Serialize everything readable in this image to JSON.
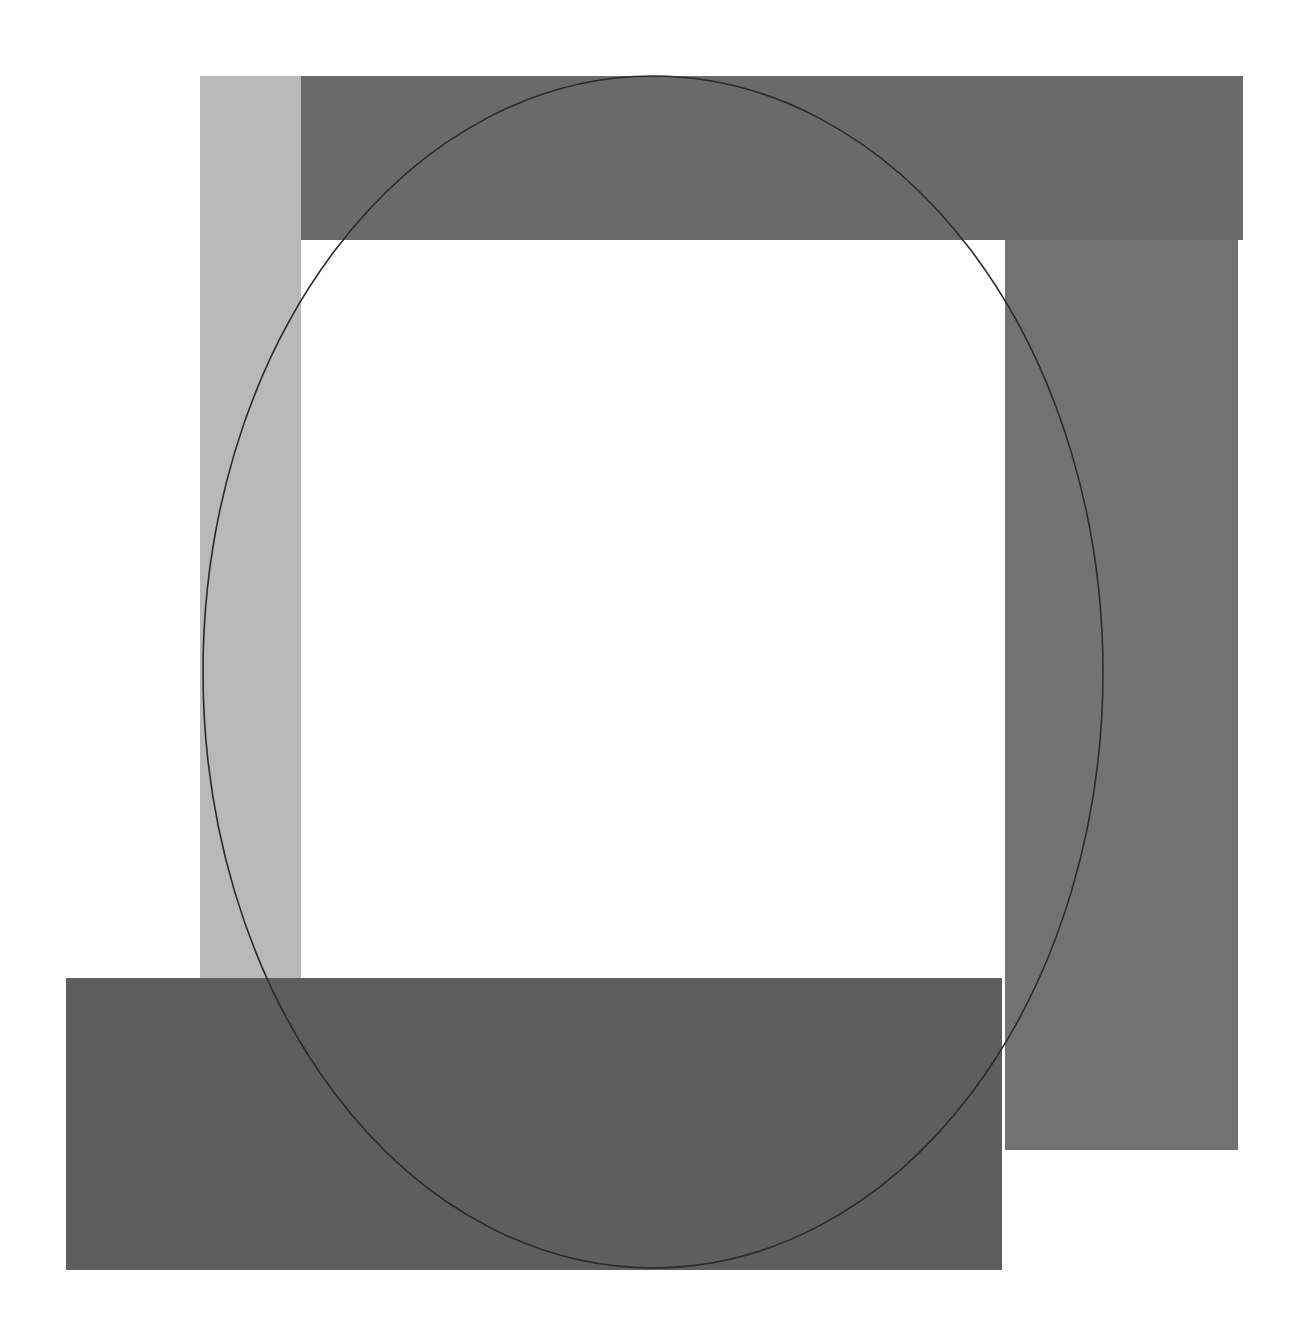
{
  "artwork": {
    "background": "#ffffff",
    "shapes": [
      {
        "name": "left-light-bar",
        "x": 200,
        "y": 76,
        "w": 101,
        "h": 904,
        "color": "#b9b9b9"
      },
      {
        "name": "top-dark-bar",
        "x": 301,
        "y": 76,
        "w": 942,
        "h": 164,
        "color": "#6a6a6a"
      },
      {
        "name": "right-bar",
        "x": 1005,
        "y": 240,
        "w": 233,
        "h": 910,
        "color": "#727272"
      },
      {
        "name": "bottom-bar",
        "x": 66,
        "y": 978,
        "w": 936,
        "h": 292,
        "color": "#5e5e5e"
      }
    ],
    "ellipse": {
      "cx": 653,
      "cy": 672,
      "rx": 450,
      "ry": 596,
      "stroke": "#2a2a2a"
    }
  }
}
